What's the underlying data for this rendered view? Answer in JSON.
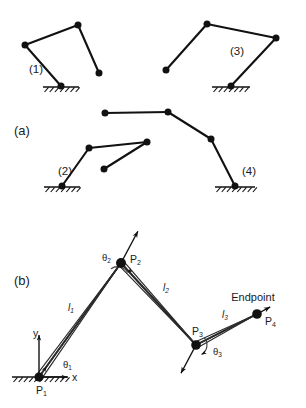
{
  "figure": {
    "background_color": "#ffffff",
    "ink_color": "#111111",
    "width": 306,
    "height": 408
  },
  "panels": [
    {
      "id": "panel-a",
      "label": "(a)",
      "x": 14,
      "y": 132
    },
    {
      "id": "panel-b",
      "label": "(b)",
      "x": 14,
      "y": 282
    }
  ],
  "panel_a": {
    "linkages": [
      {
        "id": "linkage-1",
        "label": "(1)",
        "label_x": 29,
        "label_y": 70,
        "nodes": [
          {
            "name": "node-a",
            "x": 25,
            "y": 45
          },
          {
            "name": "node-b",
            "x": 78,
            "y": 25
          },
          {
            "name": "node-c",
            "x": 99,
            "y": 73
          },
          {
            "name": "node-ground",
            "x": 61,
            "y": 86
          }
        ],
        "segments": [
          [
            0,
            1
          ],
          [
            1,
            2
          ],
          [
            0,
            3
          ]
        ],
        "ground": {
          "x": 43,
          "y": 87,
          "width": 36
        }
      },
      {
        "id": "linkage-3",
        "label": "(3)",
        "label_x": 230,
        "label_y": 52,
        "nodes": [
          {
            "name": "node-a",
            "x": 207,
            "y": 24
          },
          {
            "name": "node-b",
            "x": 276,
            "y": 38
          },
          {
            "name": "node-c",
            "x": 166,
            "y": 70
          },
          {
            "name": "node-ground",
            "x": 231,
            "y": 86
          }
        ],
        "segments": [
          [
            0,
            1
          ],
          [
            0,
            2
          ],
          [
            1,
            3
          ]
        ],
        "ground": {
          "x": 212,
          "y": 87,
          "width": 38
        }
      },
      {
        "id": "linkage-2",
        "label": "(2)",
        "label_x": 58,
        "label_y": 172,
        "nodes": [
          {
            "name": "node-ground",
            "x": 62,
            "y": 186
          },
          {
            "name": "node-b",
            "x": 89,
            "y": 148
          },
          {
            "name": "node-c",
            "x": 147,
            "y": 142
          },
          {
            "name": "node-free",
            "x": 104,
            "y": 169
          }
        ],
        "segments": [
          [
            0,
            1
          ],
          [
            1,
            2
          ],
          [
            2,
            3
          ]
        ],
        "ground": {
          "x": 44,
          "y": 187,
          "width": 36
        }
      },
      {
        "id": "linkage-4",
        "label": "(4)",
        "label_x": 242,
        "label_y": 172,
        "nodes": [
          {
            "name": "node-a",
            "x": 105,
            "y": 113
          },
          {
            "name": "node-b",
            "x": 168,
            "y": 112
          },
          {
            "name": "node-c",
            "x": 211,
            "y": 139
          },
          {
            "name": "node-ground",
            "x": 235,
            "y": 186
          }
        ],
        "segments": [
          [
            0,
            1
          ],
          [
            1,
            2
          ],
          [
            2,
            3
          ]
        ],
        "ground": {
          "x": 215,
          "y": 187,
          "width": 40
        }
      }
    ]
  },
  "panel_b": {
    "joints": [
      {
        "id": "joint-p1",
        "label": "P",
        "sub": "1",
        "x": 39,
        "y": 377,
        "r": 4.6,
        "label_dx": -3,
        "label_dy": 14
      },
      {
        "id": "joint-p2",
        "label": "P",
        "sub": "2",
        "x": 121,
        "y": 263,
        "r": 5.0,
        "label_dx": 9,
        "label_dy": -3
      },
      {
        "id": "joint-p3",
        "label": "P",
        "sub": "3",
        "x": 196,
        "y": 345,
        "r": 4.8,
        "label_dx": -4,
        "label_dy": -13
      },
      {
        "id": "joint-p4",
        "label": "P",
        "sub": "4",
        "x": 257,
        "y": 314,
        "r": 4.8,
        "label_dx": 8,
        "label_dy": 8
      }
    ],
    "links": [
      {
        "id": "link-l1",
        "from": 0,
        "to": 1,
        "label": "l",
        "sub": "1",
        "label_x": 68,
        "label_y": 308
      },
      {
        "id": "link-l2",
        "from": 1,
        "to": 2,
        "label": "l",
        "sub": "2",
        "label_x": 163,
        "label_y": 288
      },
      {
        "id": "link-l3",
        "from": 2,
        "to": 3,
        "label": "l",
        "sub": "3",
        "label_x": 222,
        "label_y": 315
      }
    ],
    "angles": [
      {
        "id": "angle-theta1",
        "label": "θ",
        "sub": "1",
        "label_x": 63,
        "label_y": 365,
        "joint": 0
      },
      {
        "id": "angle-theta2",
        "label": "θ",
        "sub": "2",
        "label_x": 102,
        "label_y": 258,
        "joint": 1
      },
      {
        "id": "angle-theta3",
        "label": "θ",
        "sub": "3",
        "label_x": 213,
        "label_y": 352,
        "joint": 2
      }
    ],
    "endpoint": {
      "label": "Endpoint",
      "x": 253,
      "y": 298
    },
    "axes": {
      "origin_x": 39,
      "origin_y": 377,
      "x_label": "x",
      "y_label": "y",
      "x_label_x": 72,
      "x_label_y": 378,
      "y_label_x": 33,
      "y_label_y": 334,
      "x_length": 28,
      "y_length": 42
    },
    "ground": {
      "x": 12,
      "y": 377,
      "width": 56
    }
  }
}
